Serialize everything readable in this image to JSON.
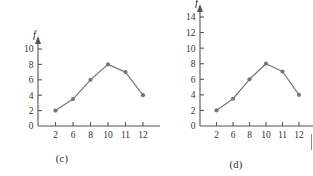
{
  "figure": {
    "background_color": "#ffffff",
    "series_color": "#777777",
    "axis_color": "#555555",
    "text_color": "#333333"
  },
  "chart_data": [
    {
      "type": "line",
      "panel_label": "(c)",
      "title": "",
      "xlabel": "x",
      "ylabel": "f",
      "x": [
        2,
        6,
        8,
        10,
        11,
        12
      ],
      "values": [
        2,
        3.5,
        6,
        8,
        7,
        4
      ],
      "xticks": [
        "2",
        "6",
        "8",
        "10",
        "11",
        "12"
      ],
      "yticks": [
        "0",
        "2",
        "4",
        "6",
        "8",
        "10"
      ],
      "ylim": [
        0,
        10
      ],
      "grid": false,
      "legend": "none",
      "marker": "circle",
      "axis_arrows": true,
      "category_spacing": "equal"
    },
    {
      "type": "line",
      "panel_label": "(d)",
      "title": "",
      "xlabel": "x",
      "ylabel": "f",
      "x": [
        2,
        6,
        8,
        10,
        11,
        12
      ],
      "values": [
        2,
        3.5,
        6,
        8,
        7,
        4
      ],
      "xticks": [
        "2",
        "6",
        "8",
        "10",
        "11",
        "12"
      ],
      "yticks": [
        "0",
        "2",
        "4",
        "6",
        "8",
        "10",
        "12",
        "14"
      ],
      "ylim": [
        0,
        14
      ],
      "grid": false,
      "legend": "none",
      "marker": "circle",
      "axis_arrows": true,
      "category_spacing": "equal"
    }
  ]
}
